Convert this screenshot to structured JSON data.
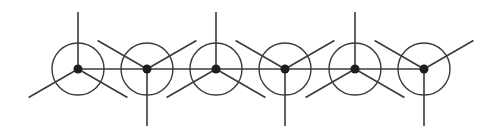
{
  "diagram": {
    "colors": {
      "background": "#ffffff",
      "line": "#3a3a3a",
      "node": "#1e1e1e"
    },
    "backbone": {
      "y": 69,
      "x_start": 78,
      "x_end": 423
    },
    "circle_radius": 26,
    "spoke_length": 57,
    "node_radius": 4.5,
    "nodes": [
      {
        "id": 1,
        "x": 78,
        "y": 69,
        "orientation": "up",
        "spoke_angles": [
          90,
          210,
          330
        ]
      },
      {
        "id": 2,
        "x": 147,
        "y": 69,
        "orientation": "down",
        "spoke_angles": [
          270,
          150,
          30
        ]
      },
      {
        "id": 3,
        "x": 216,
        "y": 69,
        "orientation": "up",
        "spoke_angles": [
          90,
          210,
          330
        ]
      },
      {
        "id": 4,
        "x": 285,
        "y": 69,
        "orientation": "down",
        "spoke_angles": [
          270,
          150,
          30
        ]
      },
      {
        "id": 5,
        "x": 355,
        "y": 69,
        "orientation": "up",
        "spoke_angles": [
          90,
          210,
          330
        ]
      },
      {
        "id": 6,
        "x": 424,
        "y": 69,
        "orientation": "down",
        "spoke_angles": [
          270,
          150,
          30
        ]
      }
    ]
  }
}
